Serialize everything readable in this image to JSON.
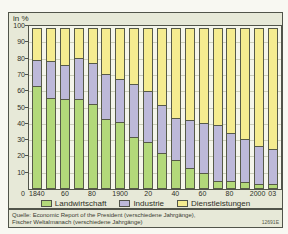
{
  "figure": {
    "unit_label": "in %",
    "source_line1": "Quelle: Economic Report of the President (verschiedene Jahrgänge),",
    "source_line2": "Fischer Weltalmanach (verschiedene Jahrgänge)",
    "figure_id": "12691E"
  },
  "colors": {
    "panel_bg": "#e7e9d8",
    "plot_bg": "#f4f5ea",
    "border": "#51544a",
    "gridline": "#cdd0bc",
    "agriculture": "#b3d97a",
    "industry": "#bdb9d9",
    "services": "#f5ec90"
  },
  "chart_data": {
    "type": "bar",
    "stacked": true,
    "title": "",
    "xlabel": "",
    "ylabel": "in %",
    "ylim": [
      0,
      100
    ],
    "grid": true,
    "legend_position": "bottom",
    "y_ticks": [
      100,
      90,
      80,
      70,
      60,
      50,
      40,
      30,
      20,
      10,
      0
    ],
    "years": [
      1840,
      1850,
      1860,
      1870,
      1880,
      1890,
      1900,
      1910,
      1920,
      1930,
      1940,
      1950,
      1960,
      1970,
      1980,
      1990,
      2000,
      2003
    ],
    "x_tick_labels": [
      "1840",
      "",
      "60",
      "",
      "80",
      "",
      "1900",
      "",
      "20",
      "",
      "40",
      "",
      "60",
      "",
      "80",
      "",
      "2000",
      "03"
    ],
    "series": [
      {
        "name": "Landwirtschaft",
        "color": "#b3d97a",
        "values": [
          63,
          56,
          55,
          55,
          52,
          43,
          41,
          32,
          29,
          22,
          18,
          13,
          10,
          5,
          5,
          4,
          3,
          3
        ]
      },
      {
        "name": "Industrie",
        "color": "#bdb9d9",
        "values": [
          17,
          23,
          22,
          26,
          26,
          28,
          27,
          33,
          32,
          30,
          26,
          30,
          31,
          35,
          30,
          27,
          24,
          22
        ]
      },
      {
        "name": "Dienstleistungen",
        "color": "#f5ec90",
        "values": [
          20,
          21,
          23,
          19,
          22,
          29,
          32,
          35,
          39,
          48,
          56,
          57,
          59,
          60,
          65,
          69,
          73,
          75
        ]
      }
    ]
  }
}
